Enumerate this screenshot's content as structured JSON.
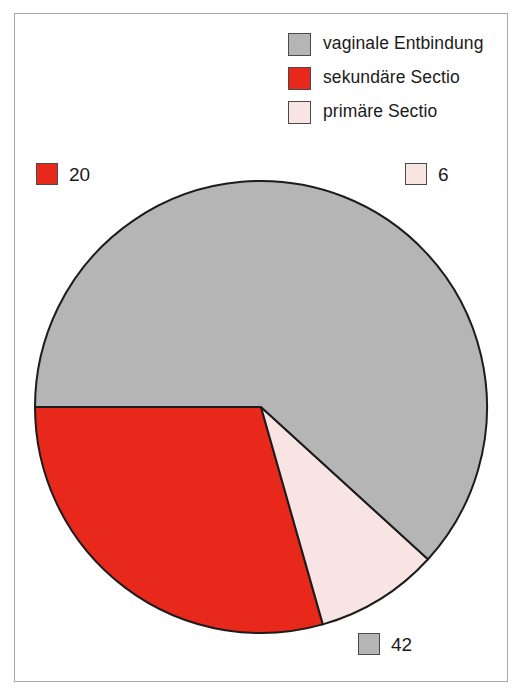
{
  "figure": {
    "background_color": "#ffffff",
    "frame_color": "#a8a8a8"
  },
  "legend": {
    "position": "top-right",
    "items": [
      {
        "label": "vaginale Entbindung",
        "color": "#b5b5b5",
        "swatch_name": "legend-swatch-gray"
      },
      {
        "label": "sekundäre Sectio",
        "color": "#e8281a",
        "swatch_name": "legend-swatch-red"
      },
      {
        "label": "primäre Sectio",
        "color": "#f9e4e4",
        "swatch_name": "legend-swatch-pink"
      }
    ]
  },
  "callouts": [
    {
      "value": "20",
      "color": "#e8281a",
      "position": "left"
    },
    {
      "value": "6",
      "color": "#f9e4e4",
      "position": "right"
    },
    {
      "value": "42",
      "color": "#b5b5b5",
      "position": "bottom"
    }
  ],
  "chart_data": {
    "type": "pie",
    "title": "",
    "xlabel": "",
    "ylabel": "",
    "categories": [
      "vaginale Entbindung",
      "sekundäre Sectio",
      "primäre Sectio"
    ],
    "values": [
      42,
      20,
      6
    ],
    "total": 68,
    "colors": [
      "#b5b5b5",
      "#e8281a",
      "#f9e4e4"
    ],
    "data_labels": [
      "42",
      "20",
      "6"
    ],
    "legend_position": "top-right",
    "grid": false,
    "geometry": {
      "center_x": 261,
      "center_y": 407,
      "radius": 226,
      "start_angle_deg": 180,
      "direction": "clockwise",
      "stroke_color": "#1c1c1c",
      "stroke_width": 2
    },
    "slice_order_from_start": [
      "sekundäre Sectio",
      "primäre Sectio",
      "vaginale Entbindung"
    ]
  }
}
